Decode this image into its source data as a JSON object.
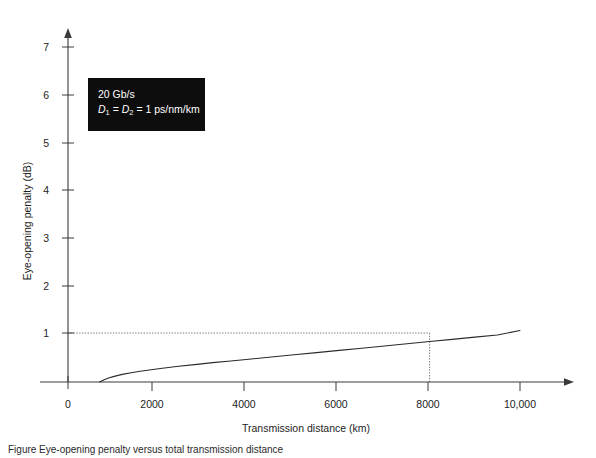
{
  "figure": {
    "caption": "Figure    Eye-opening penalty versus total transmission distance"
  },
  "annotation": {
    "line1": "20 Gb/s",
    "line2_prefix": "D",
    "line2_sub1": "1",
    "line2_mid": " = ",
    "line2_prefix2": "D",
    "line2_sub2": "2",
    "line2_suffix": " = 1 ps/nm/km",
    "box_color": "#0d0d0d",
    "text_color": "#ffffff"
  },
  "chart_data": {
    "type": "line",
    "title": "",
    "xlabel": "Transmission distance (km)",
    "ylabel": "Eye-opening penalty (dB)",
    "xlim": [
      0,
      11000
    ],
    "ylim": [
      0,
      7.5
    ],
    "xticks": [
      0,
      2000,
      4000,
      6000,
      8000,
      10000
    ],
    "xticklabels": [
      "0",
      "2000",
      "4000",
      "6000",
      "8000",
      "10,000"
    ],
    "yticks": [
      1,
      2,
      3,
      4,
      5,
      6,
      7
    ],
    "yticklabels": [
      "1",
      "2",
      "3",
      "4",
      "5",
      "6",
      "7"
    ],
    "grid": false,
    "legend": null,
    "series": [
      {
        "name": "Eye-opening penalty",
        "color": "#2b2b2b",
        "x": [
          700,
          800,
          900,
          1000,
          1200,
          1400,
          1600,
          1800,
          2000,
          2400,
          2800,
          3200,
          3600,
          4000,
          4500,
          5000,
          5500,
          6000,
          6500,
          7000,
          7500,
          8000,
          8500,
          9000,
          9500,
          10000
        ],
        "y": [
          0.0,
          0.045,
          0.08,
          0.11,
          0.155,
          0.19,
          0.22,
          0.245,
          0.27,
          0.315,
          0.355,
          0.395,
          0.43,
          0.465,
          0.51,
          0.555,
          0.6,
          0.645,
          0.69,
          0.735,
          0.78,
          0.825,
          0.87,
          0.915,
          0.96,
          1.05
        ]
      }
    ],
    "guides": [
      {
        "name": "one-db-guideline",
        "style": "dotted",
        "color": "#7a7a7a",
        "horizontal_y": 1.0,
        "horizontal_x_from": 0,
        "horizontal_x_to": 8000,
        "vertical_x": 8000,
        "vertical_y_from": 1.0,
        "vertical_y_to": 0.0
      }
    ],
    "annotations": [
      {
        "text": "20 Gb/s",
        "x_px": 98,
        "y_px": 100
      },
      {
        "text": "D1 = D2 = 1 ps/nm/km",
        "x_px": 98,
        "y_px": 117
      }
    ]
  },
  "axes": {
    "x_arrow": true,
    "y_arrow": true,
    "origin_label": "0",
    "axis_color": "#3a3a3a"
  }
}
